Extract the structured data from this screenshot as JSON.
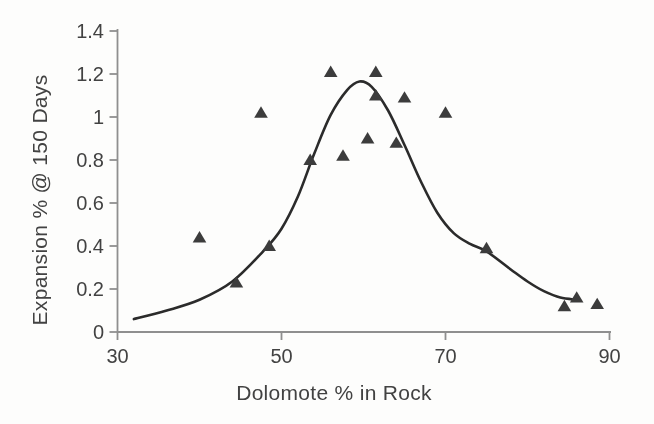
{
  "figure": {
    "background_color": "#fdfdfc",
    "axis_color": "#8f8f8f",
    "text_color": "#424242",
    "curve_color": "#2b2b2b",
    "marker_color": "#3c3c3c"
  },
  "chart_data": {
    "type": "scatter",
    "title": "",
    "xlabel": "Dolomote % in Rock",
    "ylabel": "Expansion % @ 150 Days",
    "xlim": [
      30,
      90
    ],
    "ylim": [
      0,
      1.4
    ],
    "x_ticks": [
      "30",
      "50",
      "70",
      "90"
    ],
    "y_ticks": [
      "0",
      "0.2",
      "0.4",
      "0.6",
      "0.8",
      "1",
      "1.2",
      "1.4"
    ],
    "grid": false,
    "legend_position": "none",
    "series": [
      {
        "name": "Expansion measurements",
        "type": "scatter",
        "marker": "triangle-up",
        "points": [
          [
            40,
            0.44
          ],
          [
            44.5,
            0.23
          ],
          [
            47.5,
            1.02
          ],
          [
            48.5,
            0.4
          ],
          [
            53.5,
            0.8
          ],
          [
            56,
            1.21
          ],
          [
            57.5,
            0.82
          ],
          [
            60.5,
            0.9
          ],
          [
            61.5,
            1.21
          ],
          [
            61.5,
            1.1
          ],
          [
            64,
            0.88
          ],
          [
            65,
            1.09
          ],
          [
            70,
            1.02
          ],
          [
            75,
            0.39
          ],
          [
            84.5,
            0.12
          ],
          [
            86,
            0.16
          ],
          [
            88.5,
            0.13
          ]
        ]
      },
      {
        "name": "Fitted curve",
        "type": "line",
        "points": [
          [
            32,
            0.06
          ],
          [
            36,
            0.1
          ],
          [
            40,
            0.15
          ],
          [
            44,
            0.235
          ],
          [
            48,
            0.385
          ],
          [
            50,
            0.48
          ],
          [
            52,
            0.63
          ],
          [
            54,
            0.83
          ],
          [
            56,
            1.01
          ],
          [
            58,
            1.125
          ],
          [
            59.5,
            1.165
          ],
          [
            61,
            1.14
          ],
          [
            63,
            1.03
          ],
          [
            65,
            0.87
          ],
          [
            67,
            0.7
          ],
          [
            69,
            0.555
          ],
          [
            71,
            0.46
          ],
          [
            73,
            0.41
          ],
          [
            75,
            0.375
          ],
          [
            78,
            0.29
          ],
          [
            80,
            0.235
          ],
          [
            82,
            0.19
          ],
          [
            84,
            0.16
          ],
          [
            86,
            0.15
          ]
        ]
      }
    ]
  }
}
